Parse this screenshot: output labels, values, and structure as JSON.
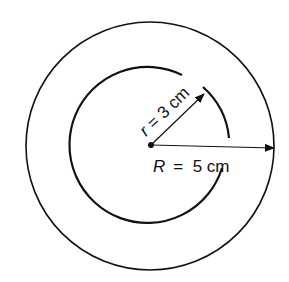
{
  "diagram": {
    "type": "concentric-circles",
    "inner_label": "r = 3 cm",
    "inner_label_r": "r",
    "inner_label_rest": " = 3 cm",
    "outer_label_R": "R",
    "outer_label_rest": "=  5 cm",
    "outer_label": "R = 5 cm",
    "inner_radius_cm": 3,
    "outer_radius_cm": 5,
    "stroke_color": "#111111"
  }
}
